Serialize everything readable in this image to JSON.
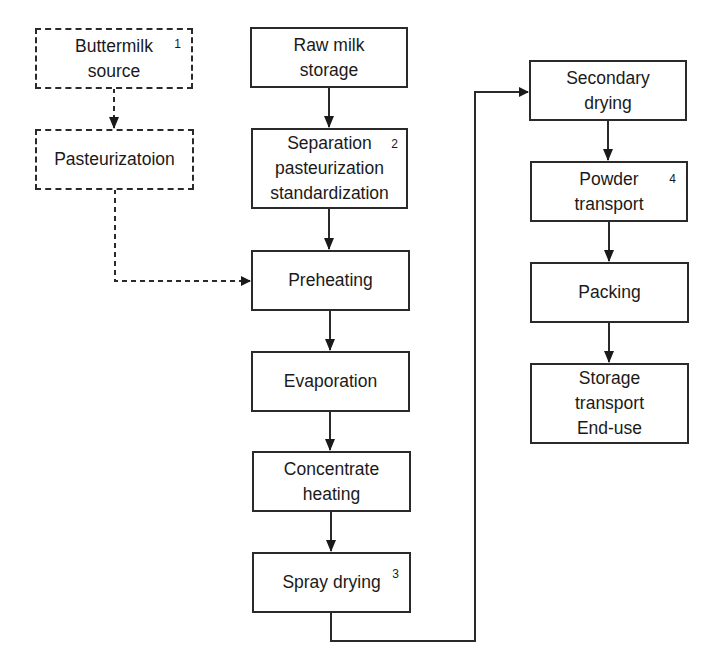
{
  "diagram": {
    "type": "flowchart",
    "nodes": {
      "buttermilk_source": {
        "label": "Buttermilk\nsource",
        "footnote": "1",
        "style": "dashed"
      },
      "pasteurization_optional": {
        "label": "Pasteurizatoion",
        "style": "dashed"
      },
      "raw_milk_storage": {
        "label": "Raw milk\nstorage",
        "style": "solid"
      },
      "separation": {
        "label": "Separation\npasteurization\nstandardization",
        "footnote": "2",
        "style": "solid"
      },
      "preheating": {
        "label": "Preheating",
        "style": "solid"
      },
      "evaporation": {
        "label": "Evaporation",
        "style": "solid"
      },
      "concentrate_heating": {
        "label": "Concentrate\nheating",
        "style": "solid"
      },
      "spray_drying": {
        "label": "Spray drying",
        "footnote": "3",
        "style": "solid"
      },
      "secondary_drying": {
        "label": "Secondary\ndrying",
        "style": "solid"
      },
      "powder_transport": {
        "label": "Powder\ntransport",
        "footnote": "4",
        "style": "solid"
      },
      "packing": {
        "label": "Packing",
        "style": "solid"
      },
      "storage_end_use": {
        "label": "Storage\ntransport\nEnd-use",
        "style": "solid"
      }
    },
    "edges": [
      {
        "from": "buttermilk_source",
        "to": "pasteurization_optional",
        "style": "dashed"
      },
      {
        "from": "pasteurization_optional",
        "to": "preheating",
        "style": "dashed"
      },
      {
        "from": "raw_milk_storage",
        "to": "separation",
        "style": "solid"
      },
      {
        "from": "separation",
        "to": "preheating",
        "style": "solid"
      },
      {
        "from": "preheating",
        "to": "evaporation",
        "style": "solid"
      },
      {
        "from": "evaporation",
        "to": "concentrate_heating",
        "style": "solid"
      },
      {
        "from": "concentrate_heating",
        "to": "spray_drying",
        "style": "solid"
      },
      {
        "from": "spray_drying",
        "to": "secondary_drying",
        "style": "solid"
      },
      {
        "from": "secondary_drying",
        "to": "powder_transport",
        "style": "solid"
      },
      {
        "from": "powder_transport",
        "to": "packing",
        "style": "solid"
      },
      {
        "from": "packing",
        "to": "storage_end_use",
        "style": "solid"
      }
    ],
    "colors": {
      "line": "#2a2a2a",
      "background": "#ffffff",
      "text": "#1a1a1a"
    }
  }
}
